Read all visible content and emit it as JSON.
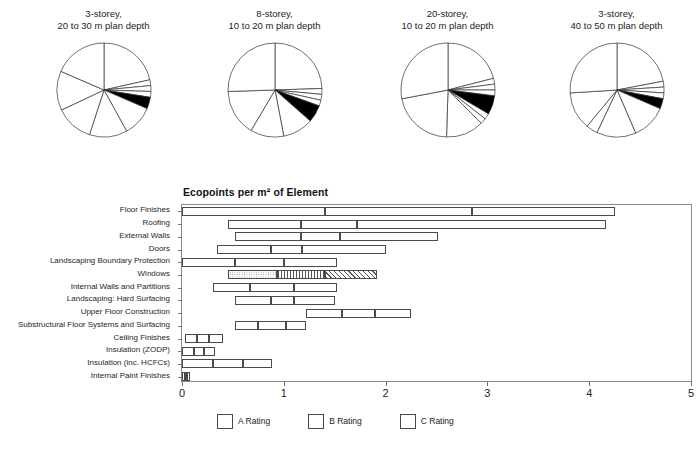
{
  "pies": {
    "charts": [
      {
        "title": "3-storey,\n20 to 30 m plan depth",
        "values": [
          21.5,
          2.0,
          2.0,
          2.0,
          4.0,
          10.5,
          13.0,
          13.0,
          13.5,
          18.5
        ],
        "highlight_index": 4
      },
      {
        "title": "8-storey,\n10 to 20 m plan depth",
        "values": [
          24.5,
          2.0,
          2.0,
          2.0,
          6.0,
          10.5,
          11.5,
          16.0,
          25.5
        ],
        "highlight_index": 4
      },
      {
        "title": "20-storey,\n10 to 20 m plan depth",
        "values": [
          21.0,
          2.0,
          2.0,
          2.0,
          6.5,
          2.0,
          2.0,
          13.0,
          21.5,
          28.0
        ],
        "highlight_index": 4
      },
      {
        "title": "3-storey,\n40 to 50 m plan depth",
        "values": [
          22.0,
          2.0,
          2.0,
          2.0,
          3.5,
          12.0,
          13.5,
          4.0,
          13.0,
          26.0
        ],
        "highlight_index": 4
      }
    ]
  },
  "chart_data": {
    "type": "bar",
    "title": "Ecopoints per m² of Element",
    "xlabel": "",
    "ylabel": "",
    "xlim": [
      0,
      5
    ],
    "xticks": [
      0,
      1,
      2,
      3,
      4,
      5
    ],
    "xticklabels": [
      "0",
      "1",
      "2",
      "3",
      "4",
      "5"
    ],
    "grid": false,
    "orientation": "horizontal",
    "note": "Each row is a floating range bar split into 3 sub-segments by rating boundaries (A/B/C). Values are ecopoints on the x axis.",
    "categories": [
      "Floor Finishes",
      "Roofing",
      "External Walls",
      "Doors",
      "Landscaping Boundary Protection",
      "Windows",
      "Internal Walls and Partitions",
      "Landscaping: Hard Surfacing",
      "Upper Floor Construction",
      "Substructural Floor Systems and Surfacing",
      "Ceiling Finishes",
      "Insulation (ZODP)",
      "Insulation (inc. HCFCs)",
      "Internal Paint Finishes"
    ],
    "rows": [
      {
        "category": "Floor Finishes",
        "start": 0.0,
        "breaks": [
          1.4,
          2.85
        ],
        "end": 4.25,
        "ratings": [
          "plain",
          "plain",
          "plain"
        ]
      },
      {
        "category": "Roofing",
        "start": 0.45,
        "breaks": [
          1.17,
          1.72
        ],
        "end": 4.17,
        "ratings": [
          "plain",
          "plain",
          "plain"
        ]
      },
      {
        "category": "External Walls",
        "start": 0.52,
        "breaks": [
          1.17,
          1.55
        ],
        "end": 2.52,
        "ratings": [
          "plain",
          "plain",
          "plain"
        ]
      },
      {
        "category": "Doors",
        "start": 0.34,
        "breaks": [
          0.87,
          1.18
        ],
        "end": 2.0,
        "ratings": [
          "plain",
          "plain",
          "plain"
        ]
      },
      {
        "category": "Landscaping Boundary Protection",
        "start": 0.0,
        "breaks": [
          0.52,
          1.0
        ],
        "end": 1.52,
        "ratings": [
          "plain",
          "plain",
          "plain"
        ]
      },
      {
        "category": "Windows",
        "start": 0.45,
        "breaks": [
          0.93,
          1.4
        ],
        "end": 1.92,
        "ratings": [
          "A",
          "B",
          "C"
        ]
      },
      {
        "category": "Internal Walls and Partitions",
        "start": 0.3,
        "breaks": [
          0.67,
          1.1
        ],
        "end": 1.52,
        "ratings": [
          "plain",
          "plain",
          "plain"
        ]
      },
      {
        "category": "Landscaping: Hard Surfacing",
        "start": 0.52,
        "breaks": [
          0.87,
          1.1
        ],
        "end": 1.5,
        "ratings": [
          "plain",
          "plain",
          "plain"
        ]
      },
      {
        "category": "Upper Floor Construction",
        "start": 1.22,
        "breaks": [
          1.57,
          1.9
        ],
        "end": 2.25,
        "ratings": [
          "plain",
          "plain",
          "plain"
        ]
      },
      {
        "category": "Substructural Floor Systems and Surfacing",
        "start": 0.52,
        "breaks": [
          0.75,
          1.02
        ],
        "end": 1.22,
        "ratings": [
          "plain",
          "plain",
          "plain"
        ]
      },
      {
        "category": "Ceiling Finishes",
        "start": 0.03,
        "breaks": [
          0.15,
          0.27
        ],
        "end": 0.4,
        "ratings": [
          "plain",
          "plain",
          "plain"
        ]
      },
      {
        "category": "Insulation (ZODP)",
        "start": 0.0,
        "breaks": [
          0.12,
          0.22
        ],
        "end": 0.32,
        "ratings": [
          "plain",
          "plain",
          "plain"
        ]
      },
      {
        "category": "Insulation (inc. HCFCs)",
        "start": 0.0,
        "breaks": [
          0.3,
          0.6
        ],
        "end": 0.88,
        "ratings": [
          "plain",
          "plain",
          "plain"
        ]
      },
      {
        "category": "Internal Paint Finishes",
        "start": 0.0,
        "breaks": [
          0.025,
          0.05
        ],
        "end": 0.075,
        "ratings": [
          "plain",
          "plain",
          "plain"
        ]
      }
    ],
    "legend": {
      "position": "bottom-left",
      "entries": [
        {
          "label": "A Rating",
          "pattern": "ratingA"
        },
        {
          "label": "B Rating",
          "pattern": "ratingB"
        },
        {
          "label": "C Rating",
          "pattern": "ratingC"
        }
      ]
    }
  }
}
